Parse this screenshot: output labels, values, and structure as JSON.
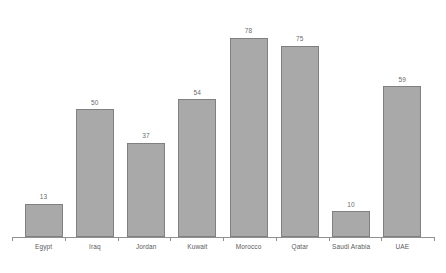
{
  "chart_data": {
    "type": "bar",
    "title": "",
    "subtitle": "",
    "xlabel": "",
    "ylabel": "",
    "categories": [
      "Egypt",
      "Iraq",
      "Jordan",
      "Kuwait",
      "Morocco",
      "Qatar",
      "Saudi Arabia",
      "UAE"
    ],
    "values": [
      13,
      50,
      37,
      54,
      78,
      75,
      10,
      59
    ],
    "value_labels": [
      "13",
      "50",
      "37",
      "54",
      "78",
      "75",
      "10",
      "59"
    ],
    "ylim": [
      0,
      85
    ],
    "grid": false,
    "legend": false,
    "legend_position": "none",
    "y_axis_visible": false,
    "x_axis_visible": true,
    "bar_color": "#a9a9a9",
    "bar_border_color": "#808080",
    "axis_color": "#909090",
    "label_color": "#5a5a5a",
    "value_label_color": "#6b6b6b",
    "background_color": "#ffffff"
  }
}
